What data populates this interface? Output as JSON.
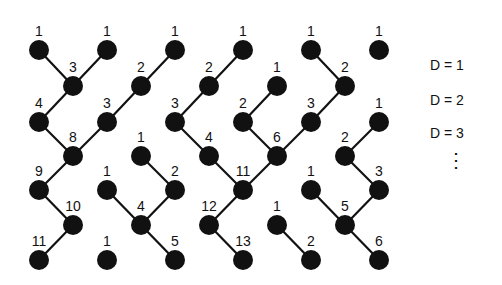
{
  "diagram": {
    "node_radius": 10,
    "node_color": "#111111",
    "edge_color": "#111111",
    "nodes": [
      {
        "x": 39,
        "y": 50,
        "label": "1"
      },
      {
        "x": 107,
        "y": 50,
        "label": "1"
      },
      {
        "x": 175,
        "y": 50,
        "label": "1"
      },
      {
        "x": 243,
        "y": 50,
        "label": "1"
      },
      {
        "x": 311,
        "y": 50,
        "label": "1"
      },
      {
        "x": 379,
        "y": 50,
        "label": "1"
      },
      {
        "x": 73,
        "y": 86,
        "label": "3"
      },
      {
        "x": 141,
        "y": 86,
        "label": "2"
      },
      {
        "x": 209,
        "y": 86,
        "label": "2"
      },
      {
        "x": 277,
        "y": 86,
        "label": "1"
      },
      {
        "x": 345,
        "y": 86,
        "label": "2"
      },
      {
        "x": 39,
        "y": 122,
        "label": "4"
      },
      {
        "x": 107,
        "y": 122,
        "label": "3"
      },
      {
        "x": 175,
        "y": 122,
        "label": "3"
      },
      {
        "x": 243,
        "y": 122,
        "label": "2"
      },
      {
        "x": 311,
        "y": 122,
        "label": "3"
      },
      {
        "x": 379,
        "y": 122,
        "label": "1"
      },
      {
        "x": 73,
        "y": 156,
        "label": "8"
      },
      {
        "x": 141,
        "y": 156,
        "label": "1"
      },
      {
        "x": 209,
        "y": 156,
        "label": "4"
      },
      {
        "x": 277,
        "y": 156,
        "label": "6"
      },
      {
        "x": 345,
        "y": 156,
        "label": "2"
      },
      {
        "x": 39,
        "y": 190,
        "label": "9"
      },
      {
        "x": 107,
        "y": 190,
        "label": "1"
      },
      {
        "x": 175,
        "y": 190,
        "label": "2"
      },
      {
        "x": 243,
        "y": 190,
        "label": "11"
      },
      {
        "x": 311,
        "y": 190,
        "label": "1"
      },
      {
        "x": 379,
        "y": 190,
        "label": "3"
      },
      {
        "x": 73,
        "y": 225,
        "label": "10"
      },
      {
        "x": 141,
        "y": 225,
        "label": "4"
      },
      {
        "x": 209,
        "y": 225,
        "label": "12"
      },
      {
        "x": 277,
        "y": 225,
        "label": "1"
      },
      {
        "x": 345,
        "y": 225,
        "label": "5"
      },
      {
        "x": 39,
        "y": 260,
        "label": "11"
      },
      {
        "x": 107,
        "y": 260,
        "label": "1"
      },
      {
        "x": 175,
        "y": 260,
        "label": "5"
      },
      {
        "x": 243,
        "y": 260,
        "label": "13"
      },
      {
        "x": 311,
        "y": 260,
        "label": "2"
      },
      {
        "x": 379,
        "y": 260,
        "label": "6"
      }
    ],
    "edges": [
      [
        39,
        50,
        73,
        86
      ],
      [
        107,
        50,
        73,
        86
      ],
      [
        73,
        86,
        39,
        122
      ],
      [
        39,
        122,
        73,
        156
      ],
      [
        175,
        50,
        141,
        86
      ],
      [
        141,
        86,
        107,
        122
      ],
      [
        107,
        122,
        73,
        156
      ],
      [
        73,
        156,
        39,
        190
      ],
      [
        39,
        190,
        73,
        225
      ],
      [
        73,
        225,
        39,
        260
      ],
      [
        243,
        50,
        209,
        86
      ],
      [
        209,
        86,
        175,
        122
      ],
      [
        175,
        122,
        209,
        156
      ],
      [
        209,
        156,
        243,
        190
      ],
      [
        277,
        86,
        243,
        122
      ],
      [
        243,
        122,
        277,
        156
      ],
      [
        277,
        156,
        243,
        190
      ],
      [
        311,
        50,
        345,
        86
      ],
      [
        345,
        86,
        311,
        122
      ],
      [
        311,
        122,
        277,
        156
      ],
      [
        243,
        190,
        209,
        225
      ],
      [
        209,
        225,
        243,
        260
      ],
      [
        141,
        156,
        175,
        190
      ],
      [
        175,
        190,
        141,
        225
      ],
      [
        107,
        190,
        141,
        225
      ],
      [
        141,
        225,
        175,
        260
      ],
      [
        379,
        122,
        345,
        156
      ],
      [
        345,
        156,
        379,
        190
      ],
      [
        379,
        190,
        345,
        225
      ],
      [
        311,
        190,
        345,
        225
      ],
      [
        345,
        225,
        379,
        260
      ],
      [
        277,
        225,
        311,
        260
      ]
    ]
  },
  "legend": {
    "items": [
      "D = 1",
      "D = 2",
      "D = 3"
    ],
    "ellipsis": "⋮"
  }
}
